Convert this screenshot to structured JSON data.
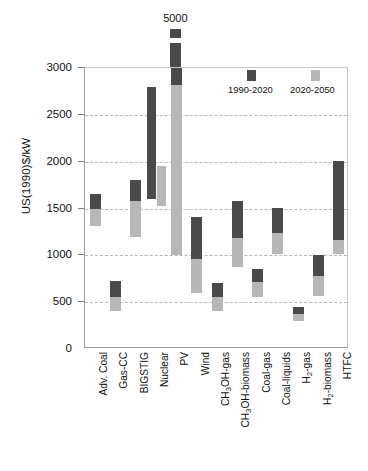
{
  "chart_data": {
    "type": "bar",
    "title": "",
    "subtitle": "",
    "xlabel": "",
    "ylabel": "US(1990)$/kW",
    "ylim": [
      0,
      3000
    ],
    "yticks": [
      0,
      500,
      1000,
      1500,
      2000,
      2500,
      3000
    ],
    "ytick_labels": [
      "0",
      "500",
      "1000",
      "1500",
      "2000",
      "2500",
      "3000"
    ],
    "grid": true,
    "grid_axis": "y",
    "legend_position": "top-right",
    "legend": [
      {
        "name": "1990-2020",
        "color": "#4a4a4a"
      },
      {
        "name": "2020-2050",
        "color": "#b7b7b7"
      }
    ],
    "annotations": [
      {
        "text": "5000",
        "category": "PV",
        "value": 5000,
        "note": "off-scale top of PV 1990-2020 range"
      }
    ],
    "categories": [
      "Adv. Coal",
      "Gas-CC",
      "BIGSTIG",
      "Nuclear",
      "PV",
      "Wind",
      "CH3OH-gas",
      "CH3OH-biomass",
      "Coal-gas",
      "Coal-liquids",
      "H2-gas",
      "H2-biomass",
      "HTFC"
    ],
    "category_labels_html": [
      "Adv. Coal",
      "Gas-CC",
      "BIGSTIG",
      "Nuclear",
      "PV",
      "Wind",
      "CH<sub>3</sub>OH-gas",
      "CH<sub>3</sub>OH-biomass",
      "Coal-gas",
      "Coal-liquids",
      "H<sub>2</sub>-gas",
      "H<sub>2</sub>-biomass",
      "HTFC"
    ],
    "series": [
      {
        "name": "1990-2020",
        "color": "#4a4a4a",
        "type": "range",
        "ranges": [
          {
            "category": "Adv. Coal",
            "low": 1490,
            "high": 1650
          },
          {
            "category": "Gas-CC",
            "low": 560,
            "high": 725
          },
          {
            "category": "BIGSTIG",
            "low": 1575,
            "high": 1800
          },
          {
            "category": "Nuclear",
            "low": 1600,
            "high": 2800
          },
          {
            "category": "PV",
            "low": 2820,
            "high": 5000
          },
          {
            "category": "Wind",
            "low": 965,
            "high": 1410
          },
          {
            "category": "CH3OH-gas",
            "low": 555,
            "high": 700
          },
          {
            "category": "CH3OH-biomass",
            "low": 1190,
            "high": 1580
          },
          {
            "category": "Coal-gas",
            "low": 710,
            "high": 855
          },
          {
            "category": "Coal-liquids",
            "low": 1235,
            "high": 1510
          },
          {
            "category": "H2-gas",
            "low": 370,
            "high": 450
          },
          {
            "category": "H2-biomass",
            "low": 775,
            "high": 1000
          },
          {
            "category": "HTFC",
            "low": 1165,
            "high": 2010
          }
        ]
      },
      {
        "name": "2020-2050",
        "color": "#b7b7b7",
        "type": "range",
        "ranges": [
          {
            "category": "Adv. Coal",
            "low": 1315,
            "high": 1490
          },
          {
            "category": "Gas-CC",
            "low": 410,
            "high": 560
          },
          {
            "category": "BIGSTIG",
            "low": 1200,
            "high": 1575
          },
          {
            "category": "Nuclear",
            "low": 1530,
            "high": 1955
          },
          {
            "category": "PV",
            "low": 1000,
            "high": 2820
          },
          {
            "category": "Wind",
            "low": 600,
            "high": 965
          },
          {
            "category": "CH3OH-gas",
            "low": 410,
            "high": 555
          },
          {
            "category": "CH3OH-biomass",
            "low": 880,
            "high": 1190
          },
          {
            "category": "Coal-gas",
            "low": 560,
            "high": 710
          },
          {
            "category": "Coal-liquids",
            "low": 1010,
            "high": 1235
          },
          {
            "category": "H2-gas",
            "low": 300,
            "high": 370
          },
          {
            "category": "H2-biomass",
            "low": 565,
            "high": 775
          },
          {
            "category": "HTFC",
            "low": 1010,
            "high": 1165
          }
        ]
      }
    ]
  },
  "colors": {
    "series_early": "#4a4a4a",
    "series_late": "#b7b7b7",
    "axis": "#9a9a9a",
    "grid": "#b9b9b9",
    "text": "#111111",
    "background": "#ffffff"
  }
}
